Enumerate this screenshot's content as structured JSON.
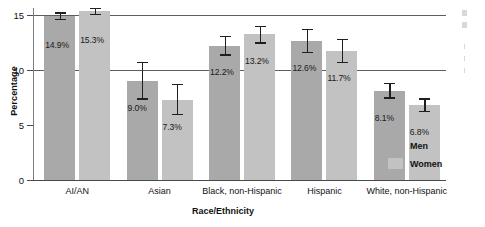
{
  "chart_data": {
    "type": "bar",
    "title": "",
    "xlabel": "Race/Ethnicity",
    "ylabel": "Percentage",
    "categories": [
      "AI/AN",
      "Asian",
      "Black, non-Hispanic",
      "Hispanic",
      "White, non-Hispanic"
    ],
    "series": [
      {
        "name": "Men",
        "color": "#a9a9a9",
        "values": [
          14.9,
          9.0,
          12.2,
          12.6,
          8.1
        ],
        "labels": [
          "14.9%",
          "9.0%",
          "12.2%",
          "12.6%",
          "8.1%"
        ],
        "error_low": [
          14.6,
          7.4,
          11.4,
          11.6,
          7.5
        ],
        "error_high": [
          15.2,
          10.7,
          13.1,
          13.7,
          8.8
        ]
      },
      {
        "name": "Women",
        "color": "#c2c2c2",
        "values": [
          15.3,
          7.3,
          13.2,
          11.7,
          6.8
        ],
        "labels": [
          "15.3%",
          "7.3%",
          "13.2%",
          "11.7%",
          "6.8%"
        ],
        "error_low": [
          15.1,
          6.0,
          12.5,
          10.7,
          6.3
        ],
        "error_high": [
          15.6,
          8.7,
          14.0,
          12.8,
          7.4
        ]
      }
    ],
    "ylim": [
      0,
      15.6
    ],
    "yticks": [
      0,
      5,
      10,
      15
    ],
    "ytick_labels": [
      "0",
      "5",
      "10",
      "15"
    ],
    "gridlines": [
      10,
      15
    ],
    "grid": true,
    "legend_position": "right",
    "legend": [
      "Men",
      "Women"
    ]
  }
}
